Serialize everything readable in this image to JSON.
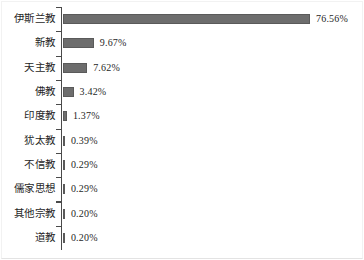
{
  "chart_data": {
    "type": "bar",
    "orientation": "horizontal",
    "title": "",
    "subtitle": "",
    "xlabel": "",
    "ylabel": "",
    "grid": false,
    "legend": false,
    "axis": {
      "category_axis": "y",
      "value_axis": "x",
      "value_suffix": "%",
      "xlim": [
        0,
        76.56
      ],
      "ticks_visible": true,
      "value_axis_line_visible": false
    },
    "colors": {
      "bar_fill": "#6d6d6d",
      "bar_stroke": "#5a5a5a",
      "axis": "#4a4a4a",
      "text": "#1f1f1f",
      "background": "#ffffff"
    },
    "categories": [
      "伊斯兰教",
      "新教",
      "天主教",
      "佛教",
      "印度教",
      "犹太教",
      "不信教",
      "儒家思想",
      "其他宗教",
      "道教"
    ],
    "values": [
      76.56,
      9.67,
      7.62,
      3.42,
      1.37,
      0.39,
      0.29,
      0.29,
      0.2,
      0.2
    ],
    "value_labels": [
      "76.56%",
      "9.67%",
      "7.62%",
      "3.42%",
      "1.37%",
      "0.39%",
      "0.29%",
      "0.29%",
      "0.20%",
      "0.20%"
    ]
  }
}
